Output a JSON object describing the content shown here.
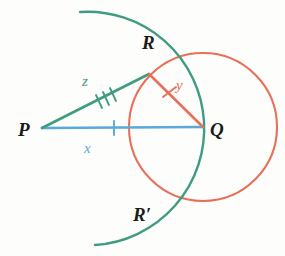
{
  "figure": {
    "background_color": "#fdfdfc"
  },
  "colors": {
    "teal": "#3f9b82",
    "orange": "#e8705a",
    "blue": "#58a9dc",
    "label_black": "#1b1b1b"
  },
  "points": {
    "P": {
      "label": "P",
      "x": 42,
      "y": 128
    },
    "Q": {
      "label": "Q",
      "x": 203,
      "y": 127
    },
    "R": {
      "label": "R",
      "x": 149,
      "y": 74
    },
    "R_prime": {
      "label": "R′",
      "x": 152,
      "y": 190
    }
  },
  "segments": [
    {
      "name": "segment-PQ",
      "label": "x",
      "color": "#58a9dc",
      "label_color": "#58a9dc",
      "tick_count": 1,
      "from": "P",
      "to": "Q"
    },
    {
      "name": "segment-PR",
      "label": "z",
      "color": "#3f9b82",
      "label_color": "#3f9b82",
      "tick_count": 3,
      "from": "P",
      "to": "R"
    },
    {
      "name": "segment-RQ",
      "label": "y",
      "color": "#e8705a",
      "label_color": "#e8705a",
      "tick_count": 1,
      "from": "R",
      "to": "Q"
    }
  ],
  "arcs": {
    "circle_Q": {
      "name": "circle-centered-at-Q",
      "color": "#e8705a",
      "center_x": 203,
      "center_y": 127,
      "radius": 74,
      "description": "full circle of radius y centered at Q"
    },
    "arc_P": {
      "name": "arc-centered-at-P",
      "color": "#3f9b82",
      "center_x": 42,
      "center_y": 128,
      "radius": 113,
      "start_x": 80,
      "start_y": 12,
      "end_x": 95,
      "end_y": 245,
      "description": "arc of radius z centered at P intersecting circle at R and R-prime"
    }
  },
  "labels": {
    "P": "P",
    "Q": "Q",
    "R": "R",
    "R_prime": "R′",
    "x": "x",
    "y": "y",
    "z": "z"
  }
}
